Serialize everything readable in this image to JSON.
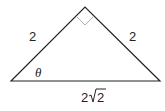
{
  "diagram": {
    "type": "right-isosceles-triangle",
    "labels": {
      "left_leg": "2",
      "right_leg": "2",
      "angle": "θ",
      "hypotenuse_coef": "2",
      "hypotenuse_radicand": "2"
    },
    "colors": {
      "stroke": "#222222",
      "right_angle_marker": "#b0b0b0"
    }
  }
}
